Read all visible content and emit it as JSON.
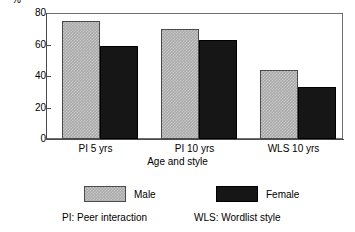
{
  "chart_data": {
    "type": "bar",
    "title": "",
    "subtitle": "",
    "xlabel": "Age and style",
    "ylabel": "%",
    "categories": [
      "PI 5 yrs",
      "PI 10 yrs",
      "WLS 10 yrs"
    ],
    "series": [
      {
        "name": "Male",
        "values": [
          75,
          70,
          44
        ],
        "color": "#a9a9a9",
        "pattern": "checkered"
      },
      {
        "name": "Female",
        "values": [
          59,
          63,
          33
        ],
        "color": "#161616",
        "pattern": "solid"
      }
    ],
    "ylim": [
      0,
      80
    ],
    "yticks": [
      0,
      20,
      40,
      60,
      80
    ],
    "ytick_labels": [
      "0",
      "20",
      "40",
      "60",
      "80"
    ],
    "grid": false,
    "legend_position": "bottom",
    "annotations": [
      "PI: Peer interaction",
      "WLS: Wordlist style"
    ]
  },
  "axis": {
    "y_label": "%",
    "x_title": "Age and style"
  },
  "legend": {
    "items": [
      {
        "label": "Male"
      },
      {
        "label": "Female"
      }
    ]
  },
  "footnotes": {
    "pi": "PI: Peer interaction",
    "wls": "WLS: Wordlist style"
  }
}
